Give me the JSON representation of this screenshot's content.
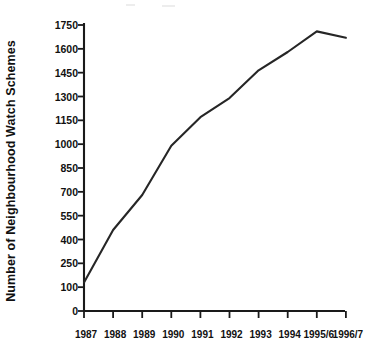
{
  "chart_data": {
    "type": "line",
    "title": "",
    "subtitle": "",
    "xlabel": "",
    "ylabel": "Number of Neighbourhood Watch Schemes",
    "categories": [
      "1987",
      "1988",
      "1989",
      "1990",
      "1991",
      "1992",
      "1993",
      "1994",
      "1995/6",
      "1996/7"
    ],
    "values": [
      130,
      460,
      680,
      990,
      1170,
      1290,
      1465,
      1580,
      1710,
      1670
    ],
    "series": [
      {
        "name": "Number of Neighbourhood Watch Schemes",
        "values": [
          130,
          460,
          680,
          990,
          1170,
          1290,
          1465,
          1580,
          1710,
          1670
        ]
      }
    ],
    "ylim": [
      0,
      1750
    ],
    "ytick_labels": [
      "0",
      "100",
      "250",
      "400",
      "550",
      "700",
      "850",
      "1000",
      "1150",
      "1300",
      "1450",
      "1600",
      "1750"
    ],
    "ytick_values": [
      0,
      100,
      250,
      400,
      550,
      700,
      850,
      1000,
      1150,
      1300,
      1450,
      1600,
      1750
    ],
    "grid": false,
    "legend": "none",
    "line_color": "#262626",
    "markers": false,
    "annotations": []
  },
  "axes": {
    "y_axis_title": "Number of Neighbourhood Watch Schemes",
    "x_axis_title": ""
  },
  "colors": {
    "line": "#262626",
    "axis": "#1a1a1a",
    "background": "#ffffff"
  }
}
